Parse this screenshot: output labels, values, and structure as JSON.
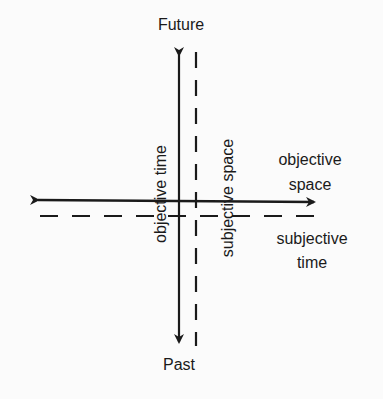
{
  "diagram": {
    "axes": {
      "objective_time": {
        "label": "objective time",
        "style": "solid",
        "orientation": "vertical",
        "top_label": "Future",
        "bottom_label": "Past"
      },
      "subjective_space": {
        "label": "subjective space",
        "style": "dashed",
        "orientation": "vertical"
      },
      "objective_space": {
        "label_line1": "objective",
        "label_line2": "space",
        "style": "solid",
        "orientation": "horizontal"
      },
      "subjective_time": {
        "label_line1": "subjective",
        "label_line2": "time",
        "style": "dashed",
        "orientation": "horizontal"
      }
    },
    "colors": {
      "ink": "#1a1a1a",
      "background": "#fbfbfb"
    }
  }
}
